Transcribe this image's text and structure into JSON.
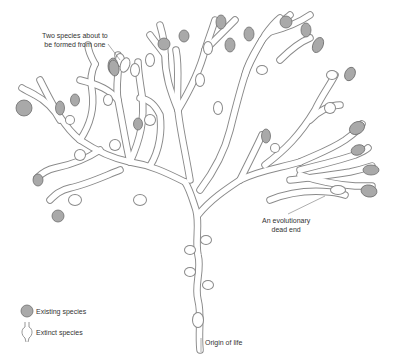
{
  "annotations": {
    "two_species": {
      "line1": "Two species about to",
      "line2": "be formed from one"
    },
    "dead_end": {
      "line1": "An evolutionary",
      "line2": "dead end"
    },
    "origin": "Origin of life"
  },
  "legend": {
    "existing": "Existing species",
    "extinct": "Extinct species"
  },
  "colors": {
    "existing_fill": "#a9a9a9",
    "outline": "#8a8a8a",
    "background": "#ffffff"
  }
}
